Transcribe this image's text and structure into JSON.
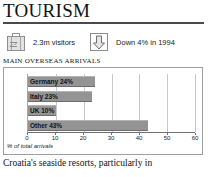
{
  "header": {
    "title": "TOURISM"
  },
  "facts": [
    {
      "icon": "suitcase-icon",
      "text": "2.3m visitors"
    },
    {
      "icon": "down-arrow-icon",
      "text": "Down 4% in 1994"
    }
  ],
  "section": {
    "heading": "MAIN OVERSEAS ARRIVALS"
  },
  "chart_data": {
    "type": "bar",
    "orientation": "horizontal",
    "title": "MAIN OVERSEAS ARRIVALS",
    "categories": [
      "Germany",
      "Italy",
      "UK",
      "Other"
    ],
    "values": [
      24,
      23,
      10,
      43
    ],
    "bar_labels": [
      "Germany 24%",
      "Italy 23%",
      "UK 10%",
      "Other 43%"
    ],
    "xlabel": "% of total arrivals",
    "ylabel": "",
    "xlim": [
      0,
      60
    ],
    "xticks": [
      0,
      10,
      20,
      30,
      40,
      50,
      60
    ],
    "xtick_labels": [
      "0",
      "10",
      "20",
      "30",
      "40",
      "50",
      "60"
    ],
    "grid": true,
    "legend": "none",
    "bar_color": "#949494",
    "plot_background": "#ffffff"
  },
  "body": {
    "paragraph": "Croatia's seaside resorts, particularly in"
  }
}
